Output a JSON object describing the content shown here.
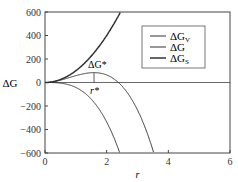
{
  "chart_data": {
    "type": "line",
    "title": "",
    "xlabel": "r",
    "ylabel": "ΔG",
    "xlim": [
      0,
      6
    ],
    "ylim": [
      -600,
      600
    ],
    "xticks": [
      "0",
      "2",
      "4",
      "6"
    ],
    "yticks": [
      "600",
      "400",
      "200",
      "0",
      "−200",
      "−400",
      "−600"
    ],
    "grid": false,
    "legend_position": "upper right",
    "series": [
      {
        "name": "ΔG_V",
        "formula": "-42 r^3",
        "x": [
          0,
          1,
          2,
          2.42
        ],
        "values": [
          0,
          -42,
          -336,
          -595
        ]
      },
      {
        "name": "ΔG",
        "formula": "100 r^2 - 42 r^3",
        "x": [
          0,
          1,
          1.59,
          2,
          2.38,
          3,
          3.5
        ],
        "values": [
          0,
          58,
          84,
          64,
          0,
          -234,
          -576
        ]
      },
      {
        "name": "ΔG_S",
        "formula": "100 r^2",
        "x": [
          0,
          1,
          2,
          2.45
        ],
        "values": [
          0,
          100,
          400,
          600
        ]
      }
    ],
    "annotations": [
      {
        "text": "ΔG*",
        "x": 1.59,
        "y": 84
      },
      {
        "text": "r*",
        "x": 1.59,
        "y": 0
      }
    ]
  },
  "legend": {
    "items": [
      {
        "label": "ΔG",
        "sub": "V"
      },
      {
        "label": "ΔG",
        "sub": ""
      },
      {
        "label": "ΔG",
        "sub": "S"
      }
    ]
  },
  "axes": {
    "xlabel": "r",
    "ylabel": "ΔG"
  },
  "annotation_peak": "ΔG*",
  "annotation_rstar": "r*"
}
